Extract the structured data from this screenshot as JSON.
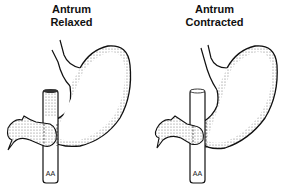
{
  "figure": {
    "panels": [
      {
        "title_line1": "Antrum",
        "title_line2": "Relaxed",
        "vessel_label": "AA"
      },
      {
        "title_line1": "Antrum",
        "title_line2": "Contracted",
        "vessel_label": "AA"
      }
    ],
    "colors": {
      "ink": "#111111",
      "background": "#ffffff",
      "shading": "#888888"
    }
  }
}
